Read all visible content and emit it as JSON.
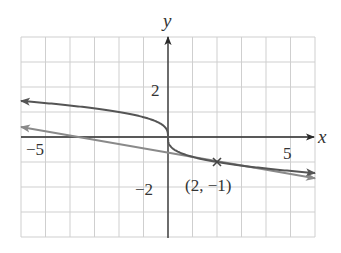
{
  "chart_data": {
    "type": "line",
    "title": "",
    "xlabel": "x",
    "ylabel": "y",
    "xlim": [
      -6,
      6
    ],
    "ylim": [
      -4,
      4
    ],
    "grid": true,
    "grid_step": 1,
    "tick_labels": {
      "x": [
        {
          "value": -5,
          "label": "−5"
        },
        {
          "value": 5,
          "label": "5"
        }
      ],
      "y": [
        {
          "value": 2,
          "label": "2"
        },
        {
          "value": -2,
          "label": "−2"
        }
      ]
    },
    "series": [
      {
        "name": "curve",
        "description": "odd, decreasing curve through origin with vertical tangent at origin; arrows at both ends",
        "color": "#555555",
        "points": [
          [
            -6,
            1.44
          ],
          [
            -5,
            1.36
          ],
          [
            -4,
            1.26
          ],
          [
            -3,
            1.14
          ],
          [
            -2,
            1.0
          ],
          [
            -1,
            0.79
          ],
          [
            -0.5,
            0.63
          ],
          [
            -0.1,
            0.37
          ],
          [
            0,
            0
          ],
          [
            0.1,
            -0.37
          ],
          [
            0.5,
            -0.63
          ],
          [
            1,
            -0.79
          ],
          [
            2,
            -1.0
          ],
          [
            3,
            -1.14
          ],
          [
            4,
            -1.26
          ],
          [
            5,
            -1.36
          ],
          [
            6,
            -1.44
          ]
        ]
      },
      {
        "name": "tangent line at (2, -1)",
        "color": "#888888",
        "points": [
          [
            -6,
            0.4
          ],
          [
            6,
            -1.65
          ]
        ]
      }
    ],
    "annotations": [
      {
        "type": "point-marker",
        "marker": "x",
        "x": 2,
        "y": -1,
        "label": "(2, −1)"
      }
    ]
  },
  "labels": {
    "x_axis": "x",
    "y_axis": "y",
    "x_tick_neg5": "−5",
    "x_tick_5": "5",
    "y_tick_2": "2",
    "y_tick_neg2": "−2",
    "point": "(2, −1)"
  },
  "colors": {
    "grid": "#cfcfcf",
    "axis": "#2a2a2a",
    "curve": "#555555",
    "tangent": "#8a8a8a"
  }
}
